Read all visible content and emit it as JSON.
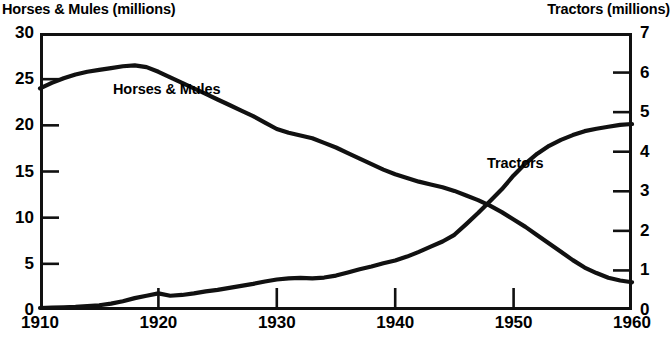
{
  "chart_data": {
    "type": "line",
    "title": "",
    "xlabel": "",
    "x": [
      1910,
      1911,
      1912,
      1913,
      1914,
      1915,
      1916,
      1917,
      1918,
      1919,
      1920,
      1921,
      1922,
      1923,
      1924,
      1925,
      1926,
      1927,
      1928,
      1929,
      1930,
      1931,
      1932,
      1933,
      1934,
      1935,
      1936,
      1937,
      1938,
      1939,
      1940,
      1941,
      1942,
      1943,
      1944,
      1945,
      1946,
      1947,
      1948,
      1949,
      1950,
      1951,
      1952,
      1953,
      1954,
      1955,
      1956,
      1957,
      1958,
      1959,
      1960
    ],
    "xlim": [
      1910,
      1960
    ],
    "xticks": [
      1910,
      1920,
      1930,
      1940,
      1950,
      1960
    ],
    "xticklabels": [
      "1910",
      "1920",
      "1930",
      "1940",
      "1950",
      "1960"
    ],
    "grid": false,
    "legend_position": "inline-annotations",
    "axes": [
      {
        "id": "left",
        "label": "Horses & Mules (millions)",
        "ylim": [
          0,
          30
        ],
        "yticks": [
          0,
          5,
          10,
          15,
          20,
          25,
          30
        ],
        "yticklabels": [
          "0",
          "5",
          "10",
          "15",
          "20",
          "25",
          "30"
        ],
        "side": "left"
      },
      {
        "id": "right",
        "label": "Tractors (millions)",
        "ylim": [
          0,
          7
        ],
        "yticks": [
          0,
          1,
          2,
          3,
          4,
          5,
          6,
          7
        ],
        "yticklabels": [
          "0",
          "1",
          "2",
          "3",
          "4",
          "5",
          "6",
          "7"
        ],
        "side": "right"
      }
    ],
    "series": [
      {
        "name": "Horses & Mules",
        "axis": "left",
        "units": "millions",
        "color": "#111111",
        "annotation": "Horses & Mules",
        "values": [
          24.0,
          24.6,
          25.1,
          25.5,
          25.8,
          26.0,
          26.2,
          26.4,
          26.5,
          26.3,
          25.8,
          25.2,
          24.6,
          24.0,
          23.4,
          22.8,
          22.2,
          21.6,
          21.0,
          20.3,
          19.6,
          19.2,
          18.9,
          18.6,
          18.1,
          17.6,
          17.0,
          16.4,
          15.8,
          15.2,
          14.7,
          14.3,
          13.9,
          13.6,
          13.3,
          12.9,
          12.4,
          11.9,
          11.3,
          10.6,
          9.8,
          9.0,
          8.1,
          7.2,
          6.3,
          5.4,
          4.6,
          4.0,
          3.5,
          3.2,
          3.0
        ]
      },
      {
        "name": "Tractors",
        "axis": "right",
        "units": "millions",
        "color": "#111111",
        "annotation": "Tractors",
        "values": [
          0.05,
          0.06,
          0.07,
          0.08,
          0.1,
          0.12,
          0.16,
          0.22,
          0.3,
          0.36,
          0.42,
          0.36,
          0.38,
          0.42,
          0.47,
          0.51,
          0.56,
          0.61,
          0.66,
          0.72,
          0.77,
          0.8,
          0.81,
          0.8,
          0.82,
          0.87,
          0.95,
          1.03,
          1.1,
          1.18,
          1.25,
          1.35,
          1.47,
          1.6,
          1.73,
          1.9,
          2.17,
          2.45,
          2.75,
          3.05,
          3.4,
          3.7,
          3.95,
          4.15,
          4.3,
          4.42,
          4.52,
          4.58,
          4.63,
          4.68,
          4.7
        ]
      }
    ],
    "annotations": [
      {
        "text": "Horses & Mules",
        "series": "Horses & Mules"
      },
      {
        "text": "Tractors",
        "series": "Tractors"
      }
    ]
  },
  "titles": {
    "left_axis": "Horses & Mules (millions)",
    "right_axis": "Tractors (millions)"
  },
  "labels": {
    "horses_inline": "Horses & Mules",
    "tractors_inline": "Tractors"
  },
  "colors": {
    "line": "#111111",
    "frame": "#111111",
    "background": "#ffffff"
  }
}
